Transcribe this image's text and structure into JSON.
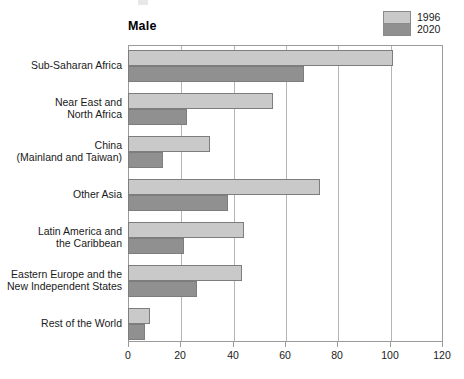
{
  "chart_data": {
    "type": "bar",
    "orientation": "horizontal",
    "title": "Male",
    "xlabel": "",
    "ylabel": "",
    "xlim": [
      0,
      120
    ],
    "xticks": [
      0,
      20,
      40,
      60,
      80,
      100,
      120
    ],
    "grid": true,
    "legend_position": "top-right",
    "categories": [
      "Sub-Saharan Africa",
      "Near East and North Africa",
      "China (Mainland and Taiwan)",
      "Other Asia",
      "Latin America and the Caribbean",
      "Eastern Europe and the New Independent States",
      "Rest of the World"
    ],
    "series": [
      {
        "name": "1996",
        "color": "#c9c9c9",
        "values": [
          101,
          55,
          31,
          73,
          44,
          43,
          8
        ]
      },
      {
        "name": "2020",
        "color": "#909090",
        "values": [
          67,
          22,
          13,
          38,
          21,
          26,
          6
        ]
      }
    ]
  },
  "category_label_lines": [
    [
      "Sub-Saharan Africa"
    ],
    [
      "Near East and",
      "North Africa"
    ],
    [
      "China",
      "(Mainland and Taiwan)"
    ],
    [
      "Other Asia"
    ],
    [
      "Latin America and",
      "the Caribbean"
    ],
    [
      "Eastern Europe and the",
      "New Independent States"
    ],
    [
      "Rest of the World"
    ]
  ],
  "xtick_labels": [
    "0",
    "20",
    "40",
    "60",
    "80",
    "100",
    "120"
  ],
  "legend": {
    "items": [
      {
        "label": "1996",
        "color": "#c9c9c9"
      },
      {
        "label": "2020",
        "color": "#909090"
      }
    ]
  },
  "colors": {
    "series_1996": "#c9c9c9",
    "series_2020": "#909090",
    "frame": "#9a9a9a",
    "gridline": "#b5b5b5",
    "bar_outline": "#7d7d7d",
    "text": "#1a1a1a",
    "background": "#ffffff"
  }
}
